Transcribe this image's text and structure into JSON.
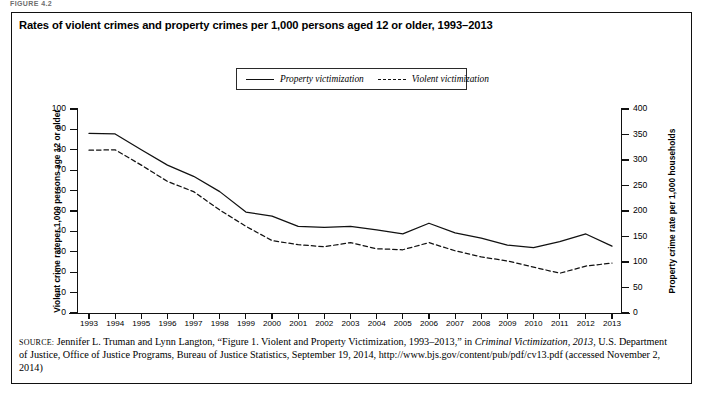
{
  "figure_label": "FIGURE 4.2",
  "title": "Rates of violent crimes and property crimes per 1,000 persons aged 12 or older, 1993–2013",
  "legend": {
    "position": "top-center",
    "items": [
      {
        "label": "Property victimization",
        "style": "solid",
        "icon": "solid-line-icon"
      },
      {
        "label": "Violent victimization",
        "style": "dashed",
        "icon": "dashed-line-icon"
      }
    ]
  },
  "axis_left_title": "Violent crime rateper 1,000 persons age 12 or older",
  "axis_right_title": "Property crime rate per 1,000 households",
  "source": {
    "prefix": "SOURCE:",
    "line": " Jennifer L. Truman and Lynn Langton, “Figure 1. Violent and Property Victimization, 1993–2013,” in ",
    "italic": "Criminal Victimization, 2013",
    "rest": ", U.S. Department of Justice, Office of Justice Programs, Bureau of Justice Statistics, September 19, 2014, http://www.bjs.gov/content/pub/pdf/cv13.pdf (accessed November 2, 2014)"
  },
  "chart_data": {
    "type": "line",
    "title": "Rates of violent crimes and property crimes per 1,000 persons aged 12 or older, 1993–2013",
    "xlabel": "",
    "ylabel": "Violent crime rateper 1,000 persons age 12 or older",
    "y2label": "Property crime rate per 1,000 households",
    "grid": false,
    "legend_position": "top-center",
    "x": [
      1993,
      1994,
      1995,
      1996,
      1997,
      1998,
      1999,
      2000,
      2001,
      2002,
      2003,
      2004,
      2005,
      2006,
      2007,
      2008,
      2009,
      2010,
      2011,
      2012,
      2013
    ],
    "categories": [
      "1993",
      "1994",
      "1995",
      "1996",
      "1997",
      "1998",
      "1999",
      "2000",
      "2001",
      "2002",
      "2003",
      "2004",
      "2005",
      "2006",
      "2007",
      "2008",
      "2009",
      "2010",
      "2011",
      "2012",
      "2013"
    ],
    "ylim": [
      0,
      100
    ],
    "yticks": [
      0,
      10,
      20,
      30,
      40,
      50,
      60,
      70,
      80,
      90,
      100
    ],
    "y2lim": [
      0,
      400
    ],
    "y2ticks": [
      0,
      50,
      100,
      150,
      200,
      250,
      300,
      350,
      400
    ],
    "series": [
      {
        "name": "Property victimization",
        "axis": "right",
        "style": "solid",
        "unit": "per 1,000 households",
        "values": [
          352,
          351,
          320,
          290,
          268,
          238,
          198,
          190,
          170,
          168,
          170,
          163,
          155,
          176,
          157,
          147,
          133,
          128,
          140,
          155,
          131
        ]
      },
      {
        "name": "Violent victimization",
        "axis": "left",
        "style": "dashed",
        "unit": "per 1,000 persons age 12 or older",
        "values": [
          79.8,
          80.0,
          72.5,
          64.5,
          59.5,
          50.5,
          42.5,
          35.5,
          33.5,
          32.5,
          34.5,
          31.5,
          31.0,
          34.5,
          30.5,
          27.5,
          25.5,
          22.5,
          19.5,
          23.0,
          24.5
        ]
      }
    ]
  }
}
